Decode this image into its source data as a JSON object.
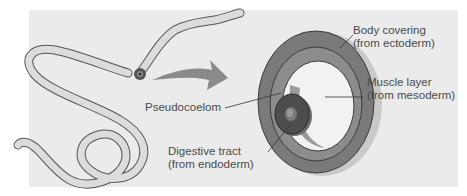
{
  "diagram": {
    "type": "cross-section illustration",
    "colors": {
      "background_panel": "#ebebeb",
      "body_covering": "#7a7a7a",
      "muscle_layer": "#8c8c8c",
      "pseudocoelom": "#f2f2f2",
      "digestive_tract": "#4d4d4d",
      "arrow": "#8a8a8a",
      "worm_fill": "#d9d9d9",
      "label_text": "#4a4a4a"
    },
    "labels": {
      "body_covering_line1": "Body covering",
      "body_covering_line2": "(from ectoderm)",
      "muscle_layer_line1": "Muscle layer",
      "muscle_layer_line2": "(from mesoderm)",
      "pseudocoelom": "Pseudocoelom",
      "digestive_tract_line1": "Digestive tract",
      "digestive_tract_line2": "(from endoderm)"
    }
  }
}
